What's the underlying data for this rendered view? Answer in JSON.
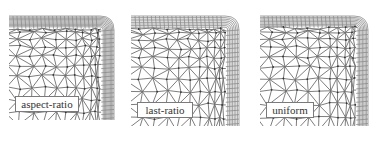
{
  "figure": {
    "panels": [
      {
        "id": "aspect-ratio",
        "label": "aspect-ratio",
        "x": 9,
        "y": 14,
        "w": 109,
        "h": 106,
        "label_box": {
          "x": 6,
          "y": 82,
          "w": 64,
          "h": 16
        },
        "seed": 3,
        "layers": 9,
        "layer_spacing": 1.2
      },
      {
        "id": "last-ratio",
        "label": "last-ratio",
        "x": 131,
        "y": 14,
        "w": 112,
        "h": 112,
        "label_box": {
          "x": 6,
          "y": 88,
          "w": 56,
          "h": 16
        },
        "seed": 7,
        "layers": 7,
        "layer_spacing": 1.6
      },
      {
        "id": "uniform",
        "label": "uniform",
        "x": 260,
        "y": 14,
        "w": 112,
        "h": 112,
        "label_box": {
          "x": 6,
          "y": 88,
          "w": 48,
          "h": 16
        },
        "seed": 11,
        "layers": 7,
        "layer_spacing": 1.4
      }
    ],
    "colors": {
      "mesh_line": "#6e6e6e",
      "node": "#333333",
      "boundary": "#8c8c8c",
      "frame": "#cccccc"
    }
  }
}
